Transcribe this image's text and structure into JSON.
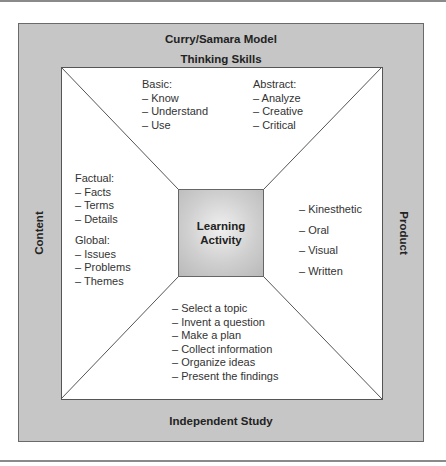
{
  "diagram": {
    "title": "Curry/Samara Model",
    "top_label": "Thinking Skills",
    "bottom_label": "Independent Study",
    "left_label": "Content",
    "right_label": "Product",
    "center": {
      "line1": "Learning",
      "line2": "Activity"
    },
    "thinking_skills": {
      "basic": {
        "heading": "Basic:",
        "items": [
          "– Know",
          "– Understand",
          "– Use"
        ]
      },
      "abstract": {
        "heading": "Abstract:",
        "items": [
          "– Analyze",
          "– Creative",
          "– Critical"
        ]
      }
    },
    "content": {
      "factual": {
        "heading": "Factual:",
        "items": [
          "– Facts",
          "– Terms",
          "– Details"
        ]
      },
      "global": {
        "heading": "Global:",
        "items": [
          "– Issues",
          "– Problems",
          "– Themes"
        ]
      }
    },
    "product": {
      "items": [
        "– Kinesthetic",
        "– Oral",
        "– Visual",
        "– Written"
      ]
    },
    "independent_study": {
      "items": [
        "– Select a topic",
        "– Invent a question",
        "– Make a plan",
        "– Collect information",
        "– Organize ideas",
        "– Present the findings"
      ]
    },
    "colors": {
      "frame_gray": "#c6c6c6",
      "inner_white": "#ffffff",
      "line": "#555555"
    }
  }
}
